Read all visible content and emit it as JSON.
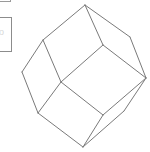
{
  "panel": {
    "glyph": "o"
  },
  "figure": {
    "name": "rhombic dodecahedron wireframe",
    "stroke": "#7a7a7a",
    "vertices": {
      "T": [
        85,
        5
      ],
      "L1": [
        43,
        40
      ],
      "R1": [
        130,
        37
      ],
      "C1": [
        103,
        45
      ],
      "L": [
        22,
        72
      ],
      "C2": [
        61,
        82
      ],
      "R": [
        146,
        78
      ],
      "B1": [
        38,
        113
      ],
      "D": [
        103,
        115
      ],
      "E": [
        124,
        111
      ],
      "B": [
        83,
        147
      ]
    },
    "edges": [
      [
        "T",
        "L1"
      ],
      [
        "T",
        "R1"
      ],
      [
        "T",
        "C1"
      ],
      [
        "L1",
        "L"
      ],
      [
        "L1",
        "C2"
      ],
      [
        "C1",
        "C2"
      ],
      [
        "C1",
        "R"
      ],
      [
        "R1",
        "R"
      ],
      [
        "L",
        "B1"
      ],
      [
        "C2",
        "B1"
      ],
      [
        "C2",
        "D"
      ],
      [
        "B1",
        "B"
      ],
      [
        "R",
        "D"
      ],
      [
        "D",
        "B"
      ],
      [
        "R",
        "E"
      ],
      [
        "E",
        "B"
      ]
    ]
  }
}
